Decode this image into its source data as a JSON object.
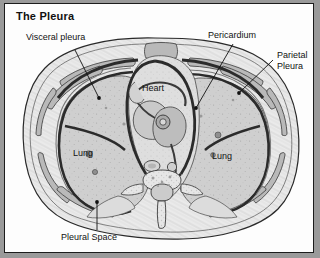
{
  "figure": {
    "title": "The Pleura",
    "kind": "anatomical-cross-section",
    "view": "axial thoracic CT-style cross section at heart level",
    "background_color": "#9a9a9a",
    "plate_color": "#fdfdfd",
    "border_color": "#1c1c1c",
    "text_color": "#111111"
  },
  "labels": {
    "visceral_pleura": "Visceral pleura",
    "pericardium": "Pericardium",
    "parietal_pleura_line1": "Parietal",
    "parietal_pleura_line2": "Pleura",
    "heart": "Heart",
    "lung_left": "Lung",
    "lung_right": "Lung",
    "pleural_space": "Pleural Space"
  },
  "structures": [
    "body wall",
    "ribs",
    "parietal pleura",
    "visceral pleura",
    "pleural space",
    "left lung",
    "right lung",
    "heart",
    "pericardium",
    "great vessels",
    "esophagus",
    "vertebral body",
    "spinal canal",
    "spinous process"
  ],
  "leader_lines": [
    {
      "label": "visceral_pleura",
      "from": [
        70,
        46
      ],
      "to": [
        94,
        94
      ]
    },
    {
      "label": "pericardium",
      "from": [
        228,
        40
      ],
      "to": [
        191,
        104
      ]
    },
    {
      "label": "parietal_pleura",
      "from": [
        268,
        56
      ],
      "to": [
        234,
        89
      ]
    },
    {
      "label": "pleural_space",
      "from": [
        92,
        226
      ],
      "to": [
        92,
        198
      ]
    }
  ]
}
